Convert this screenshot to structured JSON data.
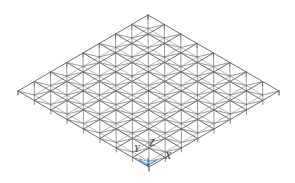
{
  "diagram": {
    "type": "space-frame grid (isometric view)",
    "grid_divisions": 8,
    "corners": {
      "top": [
        148,
        15
      ],
      "left": [
        18,
        91
      ],
      "right": [
        279,
        91
      ],
      "bottom": [
        148,
        164
      ]
    },
    "colors": {
      "background": "#ffffff",
      "member": "#6e6e6e",
      "member_light": "#a8a8a8",
      "axis_marker": "#4a8fd6",
      "label": "#333333"
    }
  },
  "axes": {
    "labels": [
      {
        "name": "Y",
        "text": "Y",
        "x": 134,
        "y": 152
      },
      {
        "name": "Z",
        "text": "Z",
        "x": 149,
        "y": 146
      },
      {
        "name": "X",
        "text": "X",
        "x": 165,
        "y": 159
      }
    ]
  }
}
